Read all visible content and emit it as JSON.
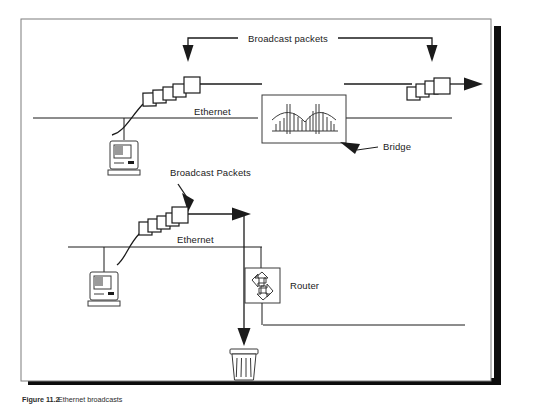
{
  "figure": {
    "caption_number": "Figure 11.2",
    "caption_text": "Ethernet broadcasts",
    "frame": {
      "border_color": "#7d7d7d",
      "shadow_color": "#0d0d0d",
      "background": "#ffffff"
    }
  },
  "diagram": {
    "type": "network-topology",
    "ink_color": "#1b1b1b",
    "labels": {
      "broadcast_top": "Broadcast packets",
      "broadcast_bottom": "Broadcast Packets",
      "ethernet_top": "Ethernet",
      "ethernet_bottom": "Ethernet",
      "bridge": "Bridge",
      "router": "Router"
    },
    "segments": [
      {
        "name": "top-segment",
        "medium": "Ethernet",
        "devices": [
          "macintosh-workstation",
          "bridge"
        ],
        "packet_trains": 2,
        "behavior": "bridge-forwards-broadcast"
      },
      {
        "name": "bottom-segment",
        "medium": "Ethernet",
        "devices": [
          "macintosh-workstation",
          "router",
          "trash"
        ],
        "packet_trains": 1,
        "behavior": "router-drops-broadcast"
      }
    ],
    "icons": [
      {
        "name": "macintosh-icon",
        "count": 2
      },
      {
        "name": "bridge-icon",
        "count": 1
      },
      {
        "name": "router-icon",
        "count": 1
      },
      {
        "name": "trash-icon",
        "count": 1
      },
      {
        "name": "packet-train-icon",
        "count": 3
      },
      {
        "name": "arrow-icon",
        "count": 6
      }
    ]
  }
}
